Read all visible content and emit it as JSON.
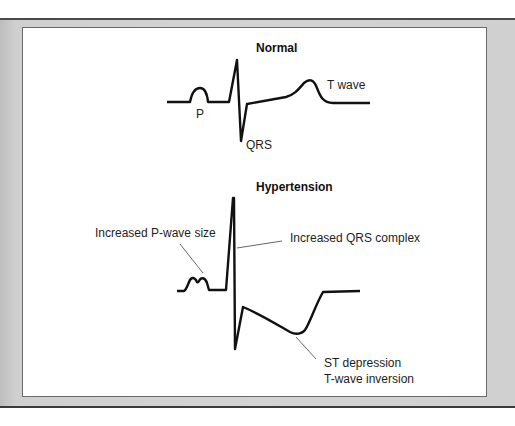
{
  "figure": {
    "sections": [
      {
        "title": "Normal",
        "labels": {
          "p": "P",
          "qrs": "QRS",
          "t": "T wave"
        }
      },
      {
        "title": "Hypertension",
        "labels": {
          "p": "Increased P-wave size",
          "qrs": "Increased QRS complex",
          "st_line1": "ST depression",
          "st_line2": "T-wave inversion"
        }
      }
    ],
    "colors": {
      "line": "#111111",
      "leader": "#555555",
      "panel_bg": "#ffffff",
      "frame_bg": "#d0d0d0"
    }
  }
}
